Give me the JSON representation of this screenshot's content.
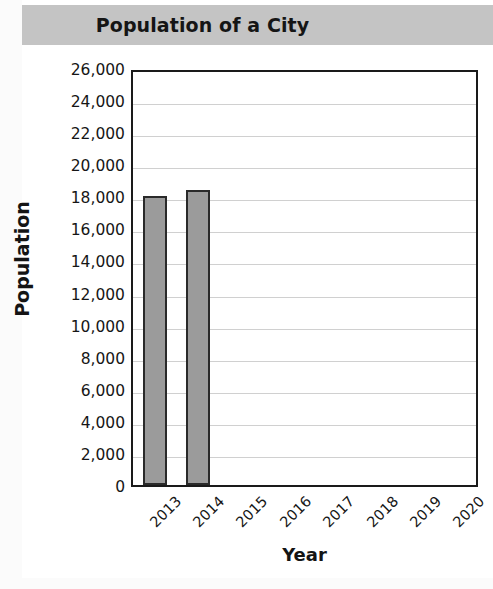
{
  "chart_data": {
    "type": "bar",
    "title": "Population of a City",
    "xlabel": "Year",
    "ylabel": "Population",
    "categories": [
      "2013",
      "2014",
      "2015",
      "2016",
      "2017",
      "2018",
      "2019",
      "2020"
    ],
    "values": [
      18000,
      18400,
      null,
      null,
      null,
      null,
      null,
      null
    ],
    "ylim": [
      0,
      26000
    ],
    "ytick_step": 2000,
    "ytick_labels": [
      "0",
      "2,000",
      "4,000",
      "6,000",
      "8,000",
      "10,000",
      "12,000",
      "14,000",
      "16,000",
      "18,000",
      "20,000",
      "22,000",
      "24,000",
      "26,000"
    ],
    "ytick_values": [
      0,
      2000,
      4000,
      6000,
      8000,
      10000,
      12000,
      14000,
      16000,
      18000,
      20000,
      22000,
      24000,
      26000
    ],
    "grid": true,
    "legend": null,
    "xtick_rotation": -45,
    "colors": {
      "bar_fill": "#9b9b9b",
      "bar_border": "#2a2a2a",
      "title_banner": "#c4c4c4",
      "gridline": "#d0d0d0",
      "axis": "#1a1a1a",
      "text": "#161616",
      "plot_background": "#ffffff"
    }
  }
}
